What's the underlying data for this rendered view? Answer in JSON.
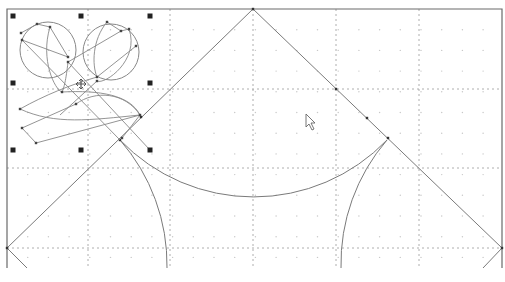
{
  "canvas": {
    "width": 505,
    "height": 282,
    "background": "#ffffff",
    "frame": {
      "left": 7,
      "top": 9,
      "right": 502,
      "bottom": 268,
      "color": "#6a6a6a"
    },
    "major_grid": {
      "x": [
        88,
        170,
        253,
        336,
        419
      ],
      "y": [
        89,
        168,
        248
      ],
      "color": "#9a9a9a",
      "dash": "2,3"
    },
    "minor_grid": {
      "spacing": 20.7,
      "color": "#c8c8c8",
      "dot_size": 1.2
    }
  },
  "drawing": {
    "stroke_color": "#7a7a7a",
    "triangle": {
      "apex": [
        253,
        9
      ],
      "left": [
        7,
        248
      ],
      "right": [
        502,
        248
      ]
    },
    "bottom_arc": {
      "from": [
        120,
        140
      ],
      "to": [
        387,
        140
      ],
      "r": 185
    },
    "left_arc": {
      "from": [
        120,
        140
      ],
      "to": [
        167,
        268
      ],
      "r": 190
    },
    "right_arc": {
      "from": [
        387,
        140
      ],
      "to": [
        341,
        268
      ],
      "r": 190
    },
    "tail_left": {
      "from": [
        7,
        248
      ],
      "to": [
        27,
        268
      ]
    },
    "tail_right": {
      "from": [
        502,
        248
      ],
      "to": [
        483,
        268
      ]
    },
    "nodes": [
      [
        253,
        9
      ],
      [
        7,
        248
      ],
      [
        502,
        248
      ],
      [
        336,
        89
      ],
      [
        367,
        118
      ],
      [
        388,
        138
      ],
      [
        120,
        140
      ],
      [
        141,
        117
      ]
    ]
  },
  "selection": {
    "label": "selected-flower-group",
    "handles": [
      [
        13,
        16
      ],
      [
        81,
        16
      ],
      [
        150,
        16
      ],
      [
        13,
        83
      ],
      [
        150,
        83
      ],
      [
        13,
        150
      ],
      [
        81,
        150
      ],
      [
        150,
        150
      ]
    ],
    "handle_size": 5,
    "handle_color": "#222222",
    "move_cursor": {
      "x": 81,
      "y": 84,
      "glyph": "move-icon"
    }
  },
  "flower": {
    "circles": [
      {
        "cx": 48,
        "cy": 50,
        "r": 28
      },
      {
        "cx": 111,
        "cy": 52,
        "r": 28
      }
    ],
    "nodes": [
      [
        21,
        33
      ],
      [
        37,
        24
      ],
      [
        50,
        27
      ],
      [
        22,
        40
      ],
      [
        68,
        57
      ],
      [
        68,
        62
      ],
      [
        107,
        22
      ],
      [
        121,
        31
      ],
      [
        129,
        29
      ],
      [
        136,
        46
      ],
      [
        97,
        77
      ],
      [
        97,
        81
      ],
      [
        62,
        92
      ],
      [
        20,
        109
      ],
      [
        76,
        104
      ],
      [
        140,
        115
      ],
      [
        22,
        128
      ],
      [
        36,
        143
      ],
      [
        122,
        138
      ]
    ]
  },
  "cursor": {
    "x": 306,
    "y": 114,
    "glyph": "arrow-pointer-icon"
  }
}
